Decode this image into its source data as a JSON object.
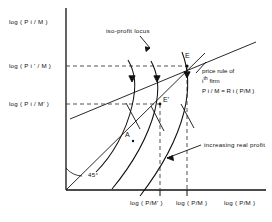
{
  "figure": {
    "axes": {
      "y_title": "",
      "x_title": "log ( P/M )",
      "origin_angle_label": "45°"
    },
    "y_ticks": [
      {
        "id": "y_top",
        "label_prefix": "log ( P",
        "sub": "i",
        "label_suffix": " / M )"
      },
      {
        "id": "y_mid",
        "label_prefix": "log ( P",
        "sub": "i",
        "label_suffix": "' / M )"
      },
      {
        "id": "y_low",
        "label_prefix": "log ( P",
        "sub": "i",
        "label_suffix": " / M' )"
      }
    ],
    "y_tick_texts": [
      "log ( P i / M )",
      "log ( P i ' / M )",
      "log ( P i / M' )"
    ],
    "x_ticks": [
      {
        "id": "x_left",
        "label": "log ( P/M' )"
      },
      {
        "id": "x_right",
        "label": "log ( P/M )"
      }
    ],
    "annotations": {
      "isoprofit": "iso-profit locus",
      "increasing": "increasing real profit",
      "price_rule_line1": "price rule of",
      "price_rule_line2_pre": "i",
      "price_rule_line2_sup": "th",
      "price_rule_line2_post": " firm",
      "price_rule_line3": "P i / M = R i ( P/M )"
    },
    "points": [
      {
        "id": "E",
        "label": "E"
      },
      {
        "id": "Ep",
        "label": "E'"
      },
      {
        "id": "A",
        "label": "A"
      }
    ],
    "colors": {
      "ink": "#111111",
      "background": "#ffffff",
      "dashed": "#444444"
    }
  }
}
